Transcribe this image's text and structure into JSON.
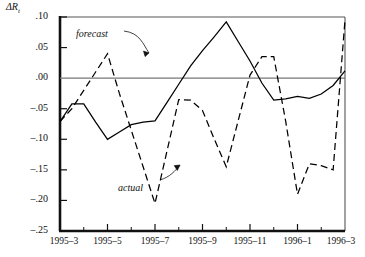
{
  "chart_data": {
    "type": "line",
    "title": "",
    "ylabel": "ΔR",
    "ylabel_sub": "t",
    "xlabel": "",
    "ylim": [
      -0.25,
      0.1
    ],
    "xlim": [
      0,
      12
    ],
    "grid": false,
    "zero_line": true,
    "y_ticks": [
      {
        "value": 0.1,
        "label": ".10"
      },
      {
        "value": 0.05,
        "label": ".05"
      },
      {
        "value": 0.0,
        "label": ".00"
      },
      {
        "value": -0.05,
        "label": "–.05"
      },
      {
        "value": -0.1,
        "label": "–.10"
      },
      {
        "value": -0.15,
        "label": "–.15"
      },
      {
        "value": -0.2,
        "label": "–.20"
      },
      {
        "value": -0.25,
        "label": "–.25"
      }
    ],
    "x_ticks": [
      {
        "value": 0,
        "label": "1995–3"
      },
      {
        "value": 2,
        "label": "1995–5"
      },
      {
        "value": 4,
        "label": "1995–7"
      },
      {
        "value": 6,
        "label": "1995–9"
      },
      {
        "value": 8,
        "label": "1995–11"
      },
      {
        "value": 10,
        "label": "1996–1"
      },
      {
        "value": 12,
        "label": "1996–3"
      }
    ],
    "x_minor_ticks": [
      1,
      3,
      5,
      7,
      9,
      11
    ],
    "series": [
      {
        "name": "forecast",
        "style": "solid",
        "color": "#000000",
        "x": [
          0,
          0.5,
          1.0,
          1.5,
          2.0,
          2.5,
          3.0,
          3.5,
          4.0,
          4.5,
          5.0,
          5.5,
          6.0,
          6.5,
          7.0,
          7.5,
          8.0,
          8.5,
          9.0,
          9.5,
          10.0,
          10.5,
          11.0,
          11.5,
          12.0
        ],
        "y": [
          -0.071,
          -0.042,
          -0.042,
          -0.072,
          -0.1,
          -0.088,
          -0.076,
          -0.072,
          -0.07,
          -0.04,
          -0.01,
          0.02,
          0.045,
          0.068,
          0.092,
          0.06,
          0.028,
          -0.008,
          -0.036,
          -0.034,
          -0.03,
          -0.033,
          -0.026,
          -0.012,
          0.012
        ]
      },
      {
        "name": "actual",
        "style": "dashed",
        "color": "#000000",
        "x": [
          0,
          0.5,
          1.0,
          1.5,
          2.0,
          2.5,
          3.0,
          3.5,
          4.0,
          4.5,
          5.0,
          5.5,
          6.0,
          6.5,
          7.0,
          7.5,
          8.0,
          8.5,
          9.0,
          9.5,
          10.0,
          10.5,
          11.0,
          11.5,
          12.0
        ],
        "y": [
          -0.071,
          -0.05,
          -0.02,
          0.01,
          0.04,
          -0.025,
          -0.085,
          -0.145,
          -0.205,
          -0.12,
          -0.035,
          -0.036,
          -0.053,
          -0.1,
          -0.145,
          -0.07,
          0.005,
          0.035,
          0.035,
          -0.07,
          -0.19,
          -0.14,
          -0.143,
          -0.15,
          0.095
        ]
      }
    ],
    "annotations": [
      {
        "text": "forecast",
        "x_px": 76,
        "y_px": 28,
        "arrow_to_x": 150,
        "arrow_to_y": 55
      },
      {
        "text": "actual",
        "x_px": 118,
        "y_px": 182,
        "arrow_to_x": 178,
        "arrow_to_y": 162
      }
    ]
  }
}
